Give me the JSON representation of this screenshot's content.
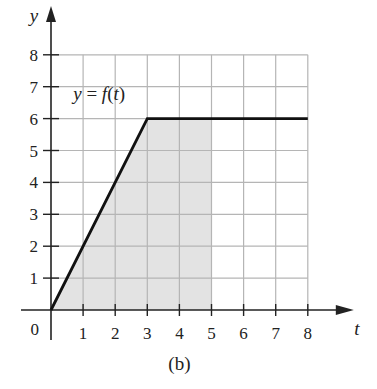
{
  "chart_data": {
    "type": "line",
    "title": "",
    "caption": "(b)",
    "xlabel": "t",
    "ylabel": "y",
    "xlim": [
      0,
      8
    ],
    "ylim": [
      0,
      8
    ],
    "grid": true,
    "x_ticks": [
      "1",
      "2",
      "3",
      "4",
      "5",
      "6",
      "7",
      "8"
    ],
    "y_ticks": [
      "1",
      "2",
      "3",
      "4",
      "5",
      "6",
      "7",
      "8"
    ],
    "origin_label": "0",
    "series": [
      {
        "name": "y = f(t)",
        "points": [
          [
            0,
            0
          ],
          [
            3,
            6
          ],
          [
            8,
            6
          ]
        ]
      }
    ],
    "annotations": [
      {
        "text": "y = f(t)",
        "x": 1.5,
        "y": 6.6
      }
    ],
    "shaded_region": {
      "description": "area under f(t) from t=0 to t=5",
      "t_from": 0,
      "t_to": 5,
      "color": "#e3e3e3"
    },
    "colors": {
      "curve": "#111111",
      "grid": "#b5b5b5",
      "axes": "#222222",
      "shade": "#e3e3e3"
    }
  }
}
